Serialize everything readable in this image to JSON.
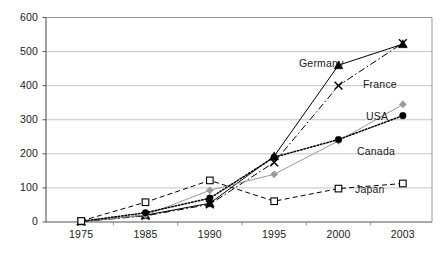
{
  "chart_data": {
    "type": "line",
    "title": "",
    "xlabel": "",
    "ylabel": "",
    "categories": [
      "1975",
      "1985",
      "1990",
      "1995",
      "2000",
      "2003"
    ],
    "ylim": [
      0,
      600
    ],
    "ytick_labels": [
      "0",
      "100",
      "200",
      "300",
      "400",
      "500",
      "600"
    ],
    "yticks": [
      0,
      100,
      200,
      300,
      400,
      500,
      600
    ],
    "grid": true,
    "legend_position": "inline-right-labels",
    "series": [
      {
        "name": "Germany",
        "marker": "filled-triangle",
        "color": "#000000",
        "line_style": "solid",
        "values": [
          2,
          20,
          55,
          193,
          460,
          522
        ]
      },
      {
        "name": "France",
        "marker": "x-cross",
        "color": "#000000",
        "line_style": "dash-dot",
        "values": [
          1,
          18,
          52,
          175,
          400,
          525
        ]
      },
      {
        "name": "USA",
        "marker": "filled-diamond",
        "color": "#999999",
        "line_style": "solid",
        "values": [
          2,
          20,
          93,
          140,
          238,
          345
        ]
      },
      {
        "name": "Canada",
        "marker": "filled-circle",
        "color": "#000000",
        "line_style": "dotted",
        "values": [
          2,
          27,
          70,
          190,
          242,
          312
        ]
      },
      {
        "name": "Japan",
        "marker": "open-square",
        "color": "#000000",
        "line_style": "dashed",
        "values": [
          3,
          58,
          122,
          61,
          98,
          113
        ]
      }
    ],
    "annotations": [
      {
        "text": "Germany",
        "x": 299,
        "y": 57
      },
      {
        "text": "France",
        "x": 363,
        "y": 78
      },
      {
        "text": "USA",
        "x": 366,
        "y": 110
      },
      {
        "text": "Canada",
        "x": 357,
        "y": 145
      },
      {
        "text": "Japan",
        "x": 355,
        "y": 183
      }
    ]
  },
  "caption": {
    "text": ""
  }
}
